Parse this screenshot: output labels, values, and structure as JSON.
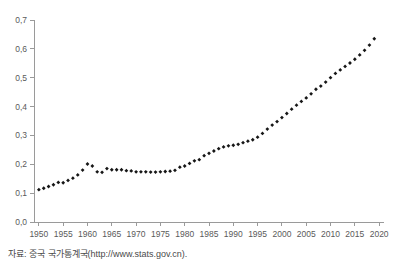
{
  "caption": {
    "source_text": "자료: 중국 국가통계국(http://www.stats.gov.cn)."
  },
  "chart_data": {
    "type": "scatter",
    "title": "",
    "subtitle": "",
    "xlabel": "",
    "ylabel": "",
    "xlim": [
      1949,
      2021
    ],
    "ylim": [
      0.0,
      0.7
    ],
    "grid": false,
    "legend": null,
    "decimal_separator": ",",
    "marker": "filled-diamond",
    "marker_color": "#161616",
    "axis_color": "#9a9a9a",
    "ytick_labels": [
      "0,0",
      "0,1",
      "0,2",
      "0,3",
      "0,4",
      "0,5",
      "0,6",
      "0,7"
    ],
    "ytick_values": [
      0.0,
      0.1,
      0.2,
      0.3,
      0.4,
      0.5,
      0.6,
      0.7
    ],
    "xtick_labels": [
      "1950",
      "1955",
      "1960",
      "1965",
      "1970",
      "1975",
      "1980",
      "1985",
      "1990",
      "1995",
      "2000",
      "2005",
      "2010",
      "2015",
      "2020"
    ],
    "xtick_values": [
      1950,
      1955,
      1960,
      1965,
      1970,
      1975,
      1980,
      1985,
      1990,
      1995,
      2000,
      2005,
      2010,
      2015,
      2020
    ],
    "x": [
      1950,
      1951,
      1952,
      1953,
      1954,
      1955,
      1956,
      1957,
      1958,
      1959,
      1960,
      1961,
      1962,
      1963,
      1964,
      1965,
      1966,
      1967,
      1968,
      1969,
      1970,
      1971,
      1972,
      1973,
      1974,
      1975,
      1976,
      1977,
      1978,
      1979,
      1980,
      1981,
      1982,
      1983,
      1984,
      1985,
      1986,
      1987,
      1988,
      1989,
      1990,
      1991,
      1992,
      1993,
      1994,
      1995,
      1996,
      1997,
      1998,
      1999,
      2000,
      2001,
      2002,
      2003,
      2004,
      2005,
      2006,
      2007,
      2008,
      2009,
      2010,
      2011,
      2012,
      2013,
      2014,
      2015,
      2016,
      2017,
      2018,
      2019
    ],
    "values": [
      0.112,
      0.117,
      0.123,
      0.129,
      0.137,
      0.136,
      0.144,
      0.152,
      0.163,
      0.18,
      0.201,
      0.194,
      0.174,
      0.172,
      0.185,
      0.181,
      0.181,
      0.181,
      0.178,
      0.177,
      0.174,
      0.174,
      0.174,
      0.173,
      0.173,
      0.174,
      0.175,
      0.176,
      0.179,
      0.19,
      0.194,
      0.203,
      0.212,
      0.216,
      0.23,
      0.238,
      0.246,
      0.254,
      0.26,
      0.264,
      0.266,
      0.269,
      0.275,
      0.28,
      0.285,
      0.294,
      0.307,
      0.322,
      0.336,
      0.348,
      0.362,
      0.376,
      0.391,
      0.405,
      0.418,
      0.43,
      0.444,
      0.46,
      0.471,
      0.485,
      0.5,
      0.515,
      0.527,
      0.539,
      0.551,
      0.564,
      0.579,
      0.595,
      0.613,
      0.635
    ]
  }
}
